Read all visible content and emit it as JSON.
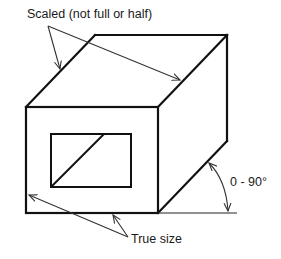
{
  "diagram": {
    "type": "oblique-projection",
    "labels": {
      "scaled": "Scaled (not full or half)",
      "true_size": "True size",
      "angle": "0 - 90°"
    },
    "colors": {
      "line": "#111111",
      "arrow": "#333333",
      "background": "#ffffff"
    }
  }
}
